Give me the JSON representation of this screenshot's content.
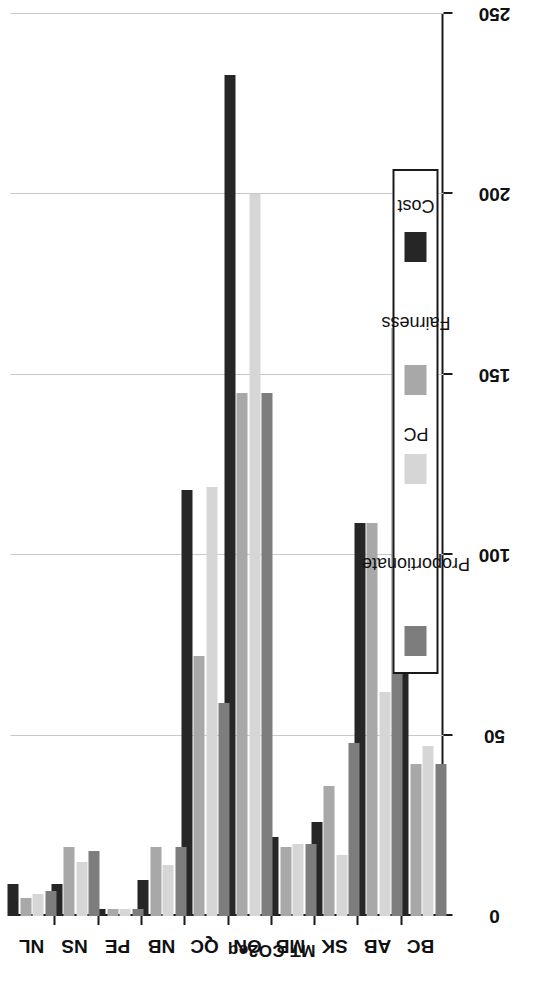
{
  "chart_data": {
    "type": "bar",
    "orientation": "vertical-rotated",
    "title": "",
    "xlabel": "",
    "ylabel": "MT CO2eq",
    "ylim": [
      0,
      250
    ],
    "yticks": [
      0,
      50,
      100,
      150,
      200,
      250
    ],
    "grid": true,
    "legend_position": "right",
    "categories": [
      "BC",
      "AB",
      "SK",
      "MB",
      "ON",
      "QC",
      "NB",
      "PE",
      "NS",
      "NL"
    ],
    "series": [
      {
        "name": "Proportionate",
        "color": "#7d7d7d",
        "values": [
          42,
          163,
          48,
          20,
          145,
          59,
          19,
          2,
          18,
          7
        ]
      },
      {
        "name": "PC",
        "color": "#d6d6d6",
        "values": [
          47,
          62,
          17,
          20,
          200,
          119,
          14,
          2,
          15,
          6
        ]
      },
      {
        "name": "Fairness",
        "color": "#a8a8a8",
        "values": [
          42,
          109,
          36,
          19,
          145,
          72,
          19,
          2,
          19,
          5
        ]
      },
      {
        "name": "Cost",
        "color": "#262626",
        "values": [
          76,
          109,
          26,
          22,
          233,
          118,
          10,
          2,
          9,
          9
        ]
      }
    ]
  },
  "axis": {
    "y_title": "MT CO2eq",
    "tick_labels": [
      "0",
      "50",
      "100",
      "150",
      "200",
      "250"
    ],
    "category_labels": [
      "BC",
      "AB",
      "SK",
      "MB",
      "ON",
      "QC",
      "NB",
      "PE",
      "NS",
      "NL"
    ]
  },
  "legend": {
    "items": [
      {
        "label": "Proportionate",
        "color": "#7d7d7d"
      },
      {
        "label": "PC",
        "color": "#d6d6d6"
      },
      {
        "label": "Fairness",
        "color": "#a8a8a8"
      },
      {
        "label": "Cost",
        "color": "#262626"
      }
    ]
  }
}
